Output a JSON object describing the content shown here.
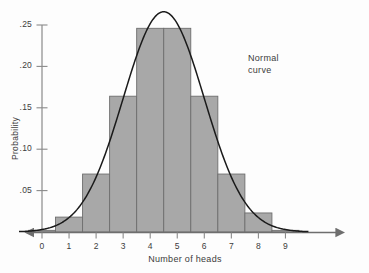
{
  "chart_data": {
    "type": "bar",
    "title": "",
    "subtitle": "",
    "xlabel": "Number of heads",
    "ylabel": "Probability",
    "categories": [
      "0",
      "1",
      "2",
      "3",
      "4",
      "5",
      "6",
      "7",
      "8",
      "9"
    ],
    "values": [
      0.002,
      0.018,
      0.07,
      0.164,
      0.246,
      0.246,
      0.164,
      0.07,
      0.023,
      0.002
    ],
    "xlim": [
      -0.5,
      9.5
    ],
    "ylim": [
      0,
      0.275
    ],
    "xticks": [
      "0",
      "1",
      "2",
      "3",
      "4",
      "5",
      "6",
      "7",
      "8",
      "9"
    ],
    "yticks": [
      ".05",
      ".10",
      ".15",
      ".20",
      ".25"
    ],
    "ytick_values": [
      0.05,
      0.1,
      0.15,
      0.2,
      0.25
    ],
    "grid": false,
    "legend": "none",
    "bar_color": "#a8a8a8",
    "bar_edge_color": "#6e6e6e",
    "axis_color": "#8a8a8a",
    "curve_color": "#1a1a1a",
    "overlay": {
      "type": "line",
      "name": "Normal curve",
      "mean": 4.5,
      "sigma": 1.5,
      "peak": 0.266,
      "annotation_line1": "Normal",
      "annotation_line2": "curve"
    }
  },
  "axes": {
    "xlabel": "Number of heads",
    "ylabel": "Probability",
    "xticks": [
      "0",
      "1",
      "2",
      "3",
      "4",
      "5",
      "6",
      "7",
      "8",
      "9"
    ],
    "yticks": [
      ".05",
      ".10",
      ".15",
      ".20",
      ".25"
    ]
  },
  "annotation": {
    "line1": "Normal",
    "line2": "curve"
  }
}
